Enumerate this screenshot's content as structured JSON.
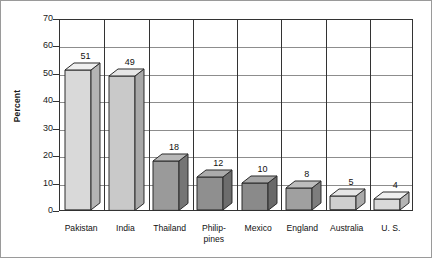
{
  "chart_data": {
    "type": "bar",
    "title": "",
    "xlabel": "",
    "ylabel": "Percent",
    "ylim": [
      0,
      70
    ],
    "ytick_values": [
      70,
      60,
      50,
      40,
      30,
      20,
      10,
      0
    ],
    "grid": true,
    "legend": "none",
    "style": "3d-bar",
    "categories": [
      "Pakistan",
      "India",
      "Thailand",
      "Philip-\npines",
      "Mexico",
      "England",
      "Australia",
      "U. S."
    ],
    "values": [
      51,
      49,
      18,
      12,
      10,
      8,
      5,
      4
    ],
    "value_labels": [
      "51",
      "49",
      "18",
      "12",
      "10",
      "8",
      "5",
      "4"
    ],
    "bar_colors": [
      "#d9d9d9",
      "#c9c9c9",
      "#9a9a9a",
      "#8f8f8f",
      "#8a8a8a",
      "#a0a0a0",
      "#cfcfcf",
      "#d9d9d9"
    ],
    "bar_side_colors": [
      "#b4b4b4",
      "#a8a8a8",
      "#757575",
      "#6d6d6d",
      "#696969",
      "#7d7d7d",
      "#ababab",
      "#b4b4b4"
    ],
    "bar_top_colors": [
      "#efefef",
      "#e6e6e6",
      "#b8b8b8",
      "#ababab",
      "#a6a6a6",
      "#bdbdbd",
      "#e6e6e6",
      "#efefef"
    ]
  },
  "axis": {
    "y_title": "Percent",
    "ticks": [
      "70",
      "60",
      "50",
      "40",
      "30",
      "20",
      "10",
      "0"
    ]
  }
}
